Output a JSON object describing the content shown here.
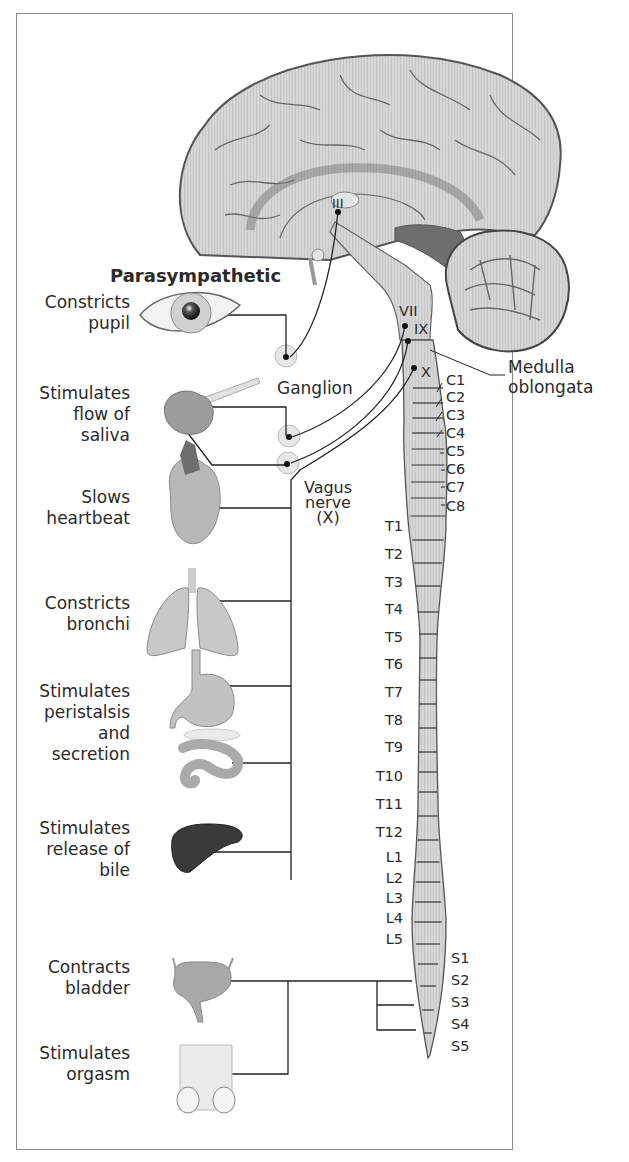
{
  "diagram": {
    "title": "Parasympathetic",
    "effects": [
      {
        "id": "eye",
        "organ": "eye",
        "lines": [
          "Constricts",
          "pupil"
        ]
      },
      {
        "id": "salivary",
        "organ": "salivary-gland",
        "lines": [
          "Stimulates",
          "flow of",
          "saliva"
        ]
      },
      {
        "id": "heart",
        "organ": "heart",
        "lines": [
          "Slows",
          "heartbeat"
        ]
      },
      {
        "id": "lungs",
        "organ": "lungs",
        "lines": [
          "Constricts",
          "bronchi"
        ]
      },
      {
        "id": "gut",
        "organ": "stomach-and-intestine",
        "lines": [
          "Stimulates",
          "peristalsis",
          "and",
          "secretion"
        ]
      },
      {
        "id": "liver",
        "organ": "liver",
        "lines": [
          "Stimulates",
          "release of",
          "bile"
        ]
      },
      {
        "id": "bladder",
        "organ": "bladder",
        "lines": [
          "Contracts",
          "bladder"
        ]
      },
      {
        "id": "genitals",
        "organ": "genitals",
        "lines": [
          "Stimulates",
          "orgasm"
        ]
      }
    ],
    "cranial_nerves": [
      "III",
      "VII",
      "IX",
      "X"
    ],
    "labels": {
      "ganglion": "Ganglion",
      "vagus": [
        "Vagus",
        "nerve",
        "(X)"
      ],
      "medulla": [
        "Medulla",
        "oblongata"
      ]
    },
    "segments": {
      "cervical": [
        "C1",
        "C2",
        "C3",
        "C4",
        "C5",
        "C6",
        "C7",
        "C8"
      ],
      "thoracic": [
        "T1",
        "T2",
        "T3",
        "T4",
        "T5",
        "T6",
        "T7",
        "T8",
        "T9",
        "T10",
        "T11",
        "T12"
      ],
      "lumbar": [
        "L1",
        "L2",
        "L3",
        "L4",
        "L5"
      ],
      "sacral": [
        "S1",
        "S2",
        "S3",
        "S4",
        "S5"
      ]
    },
    "colors": {
      "frame": "#8a8a8a",
      "tissue": "#d4d4d4",
      "tissue_dark": "#6e6e6e",
      "line": "#333333",
      "liver": "#3a3a3a"
    }
  }
}
